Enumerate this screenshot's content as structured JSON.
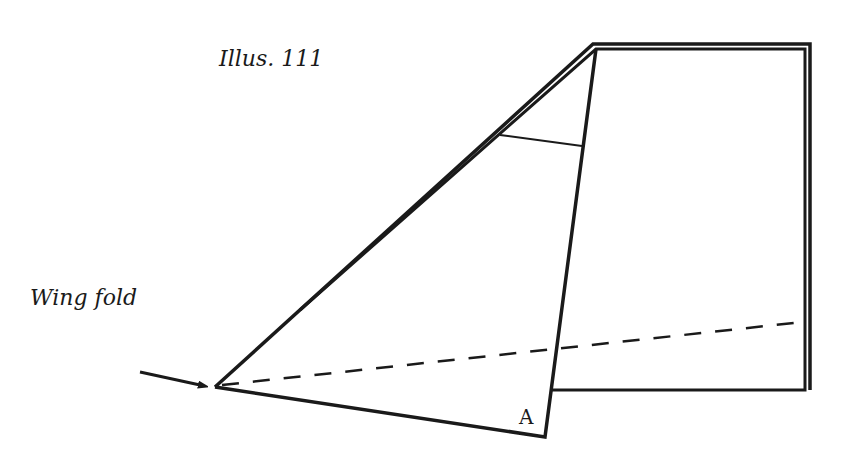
{
  "figure": {
    "title": "Illus. 111",
    "labels": {
      "wing_fold": "Wing fold",
      "point_a": "A"
    },
    "colors": {
      "line": "#1a1a1a",
      "background": "#ffffff"
    },
    "geometry": {
      "outer_edge_path": "M215,387 L593,44 L810,44 L810,390",
      "inner_edge_path": "M221,384 L596,49 L805,49 L805,390 L552,390",
      "flap_line": "M596,49 L545,437 L215,387",
      "cross_line": "M500,135 L582,146",
      "fold_dashed": "M218,385 L805,322",
      "arrow": "M140,372 L202,385"
    }
  }
}
